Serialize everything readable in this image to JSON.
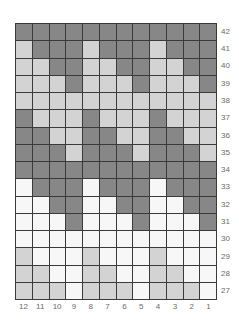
{
  "chart_data": {
    "type": "table",
    "title": "",
    "colors": {
      "D": "#878787",
      "L": "#d3d3d3",
      "W": "#f7f7f7",
      "grid_line": "#3a3a3a",
      "label": "#6a6a6a"
    },
    "columns": [
      "12",
      "11",
      "10",
      "9",
      "8",
      "7",
      "6",
      "5",
      "4",
      "3",
      "2",
      "1"
    ],
    "rows": [
      {
        "label": "42",
        "cells": [
          "D",
          "D",
          "D",
          "D",
          "D",
          "D",
          "D",
          "D",
          "D",
          "D",
          "D",
          "D"
        ]
      },
      {
        "label": "41",
        "cells": [
          "L",
          "D",
          "D",
          "D",
          "L",
          "D",
          "D",
          "D",
          "L",
          "D",
          "D",
          "D"
        ]
      },
      {
        "label": "40",
        "cells": [
          "L",
          "L",
          "D",
          "D",
          "L",
          "L",
          "D",
          "D",
          "L",
          "L",
          "D",
          "D"
        ]
      },
      {
        "label": "39",
        "cells": [
          "L",
          "L",
          "L",
          "D",
          "L",
          "L",
          "L",
          "D",
          "L",
          "L",
          "L",
          "D"
        ]
      },
      {
        "label": "38",
        "cells": [
          "L",
          "L",
          "L",
          "L",
          "L",
          "L",
          "L",
          "L",
          "L",
          "L",
          "L",
          "L"
        ]
      },
      {
        "label": "37",
        "cells": [
          "D",
          "L",
          "L",
          "L",
          "D",
          "L",
          "L",
          "L",
          "D",
          "L",
          "L",
          "L"
        ]
      },
      {
        "label": "36",
        "cells": [
          "D",
          "D",
          "L",
          "L",
          "D",
          "D",
          "L",
          "L",
          "D",
          "D",
          "L",
          "L"
        ]
      },
      {
        "label": "35",
        "cells": [
          "D",
          "D",
          "D",
          "L",
          "D",
          "D",
          "D",
          "L",
          "D",
          "D",
          "D",
          "L"
        ]
      },
      {
        "label": "34",
        "cells": [
          "D",
          "D",
          "D",
          "D",
          "D",
          "D",
          "D",
          "D",
          "D",
          "D",
          "D",
          "D"
        ]
      },
      {
        "label": "33",
        "cells": [
          "W",
          "D",
          "D",
          "D",
          "W",
          "D",
          "D",
          "D",
          "W",
          "D",
          "D",
          "D"
        ]
      },
      {
        "label": "32",
        "cells": [
          "W",
          "W",
          "D",
          "D",
          "W",
          "W",
          "D",
          "D",
          "W",
          "W",
          "D",
          "D"
        ]
      },
      {
        "label": "31",
        "cells": [
          "W",
          "W",
          "W",
          "D",
          "W",
          "W",
          "W",
          "D",
          "W",
          "W",
          "W",
          "D"
        ]
      },
      {
        "label": "30",
        "cells": [
          "W",
          "W",
          "W",
          "W",
          "W",
          "W",
          "W",
          "W",
          "W",
          "W",
          "W",
          "W"
        ]
      },
      {
        "label": "29",
        "cells": [
          "L",
          "W",
          "W",
          "W",
          "L",
          "W",
          "W",
          "W",
          "L",
          "W",
          "W",
          "W"
        ]
      },
      {
        "label": "28",
        "cells": [
          "L",
          "L",
          "W",
          "W",
          "L",
          "L",
          "W",
          "W",
          "L",
          "L",
          "W",
          "W"
        ]
      },
      {
        "label": "27",
        "cells": [
          "L",
          "L",
          "L",
          "W",
          "L",
          "L",
          "L",
          "W",
          "L",
          "L",
          "L",
          "W"
        ]
      }
    ]
  }
}
